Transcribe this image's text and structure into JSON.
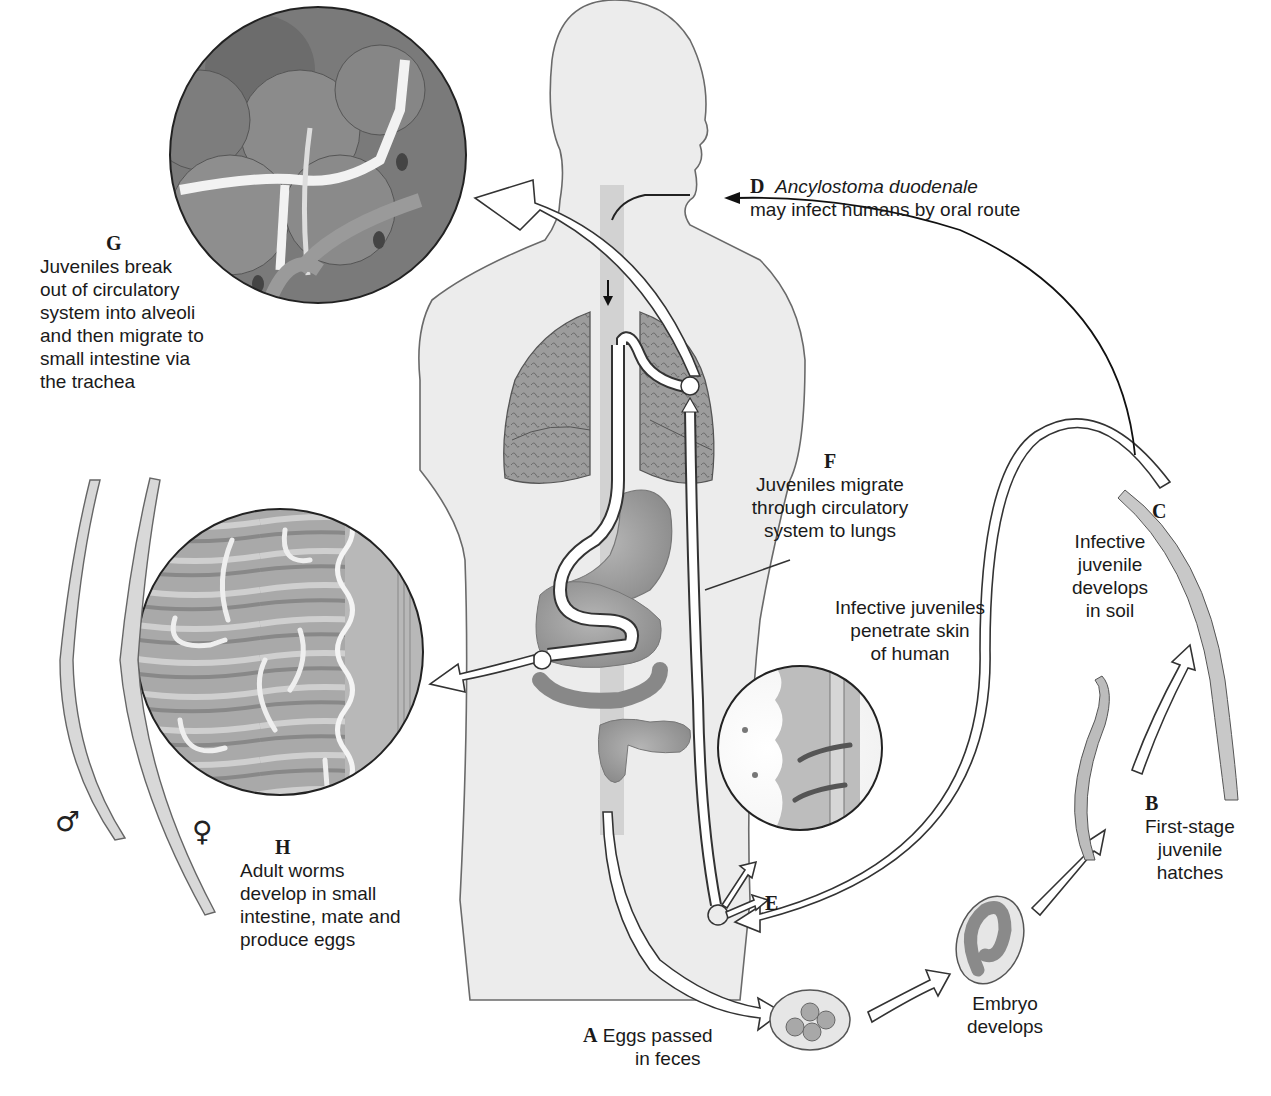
{
  "colors": {
    "background": "#ffffff",
    "body_fill": "#ececec",
    "outline": "#555555",
    "tissue": "#9a9a9a",
    "arrow_fill": "#ffffff",
    "text": "#1a1a1a"
  },
  "stages": [
    {
      "letter": "A",
      "lines": [
        "Eggs passed",
        "in feces"
      ]
    },
    {
      "letter": "",
      "lines": [
        "Embryo",
        "develops"
      ]
    },
    {
      "letter": "B",
      "lines": [
        "First-stage",
        "juvenile",
        "hatches"
      ]
    },
    {
      "letter": "C",
      "lines": [
        "Infective",
        "juvenile",
        "develops",
        "in soil"
      ]
    },
    {
      "letter": "D",
      "species": "Ancylostoma duodenale",
      "lines": [
        "may infect humans by oral route"
      ]
    },
    {
      "letter": "E",
      "lines": [
        "Infective juveniles",
        "penetrate skin",
        "of human"
      ]
    },
    {
      "letter": "F",
      "lines": [
        "Juveniles migrate",
        "through circulatory",
        "system to lungs"
      ]
    },
    {
      "letter": "G",
      "lines": [
        "Juveniles break",
        "out of circulatory",
        "system into alveoli",
        "and then migrate to",
        "small intestine via",
        "the trachea"
      ]
    },
    {
      "letter": "H",
      "lines": [
        "Adult worms",
        "develop in small",
        "intestine, mate and",
        "produce eggs"
      ]
    }
  ],
  "symbols": {
    "male": "♂",
    "female": "♀"
  }
}
